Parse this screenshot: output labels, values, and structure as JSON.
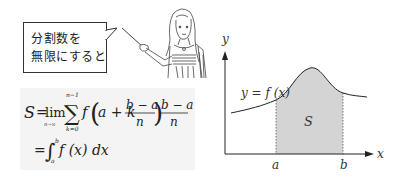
{
  "speech_bubble": {
    "line1": "分割数を",
    "line2": "無限にすると"
  },
  "formula": {
    "lhs": "S",
    "eq": "=",
    "lim": "lim",
    "lim_sub": "n→∞",
    "sum_sym": "∑",
    "sum_upper": "n−1",
    "sum_lower": "k=0",
    "f": "f",
    "arg_prefix": "a + k",
    "frac_num": "b − a",
    "frac_den": "n",
    "line2_eq": "=",
    "integral_sym": "∫",
    "int_upper": "b",
    "int_lower": "a",
    "integrand": "f (x) dx"
  },
  "graph": {
    "y_axis_label": "y",
    "x_axis_label": "x",
    "curve_label": "y = f (x)",
    "area_label": "S",
    "tick_a": "a",
    "tick_b": "b",
    "shade_color": "#d4d4d4",
    "line_color": "#222222"
  },
  "illustration": {
    "description": "teacher-with-pointer"
  }
}
